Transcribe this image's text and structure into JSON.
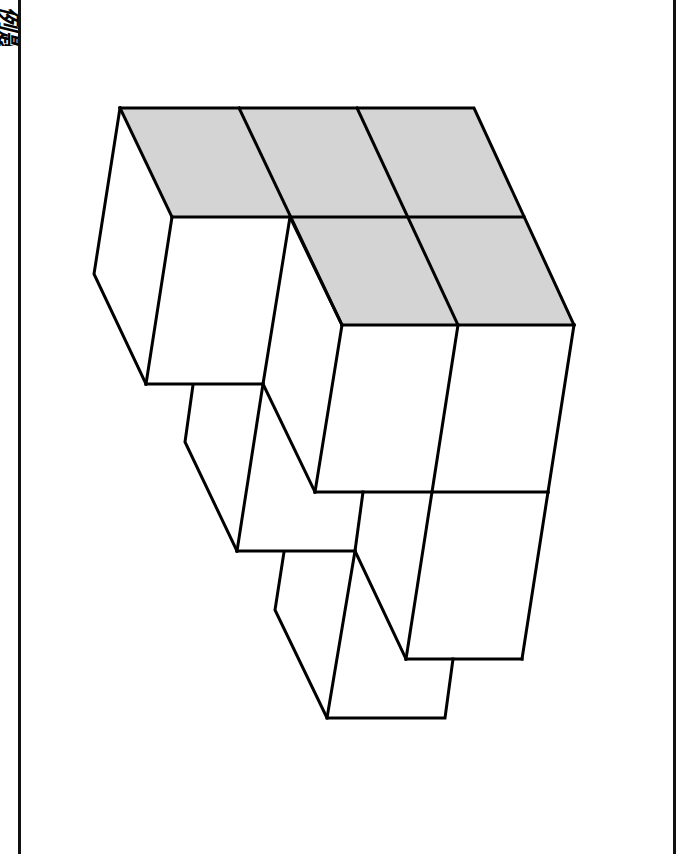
{
  "page": {
    "corner_label": "例题",
    "background": "#ffffff",
    "border_color": "#111111"
  },
  "figure": {
    "shade_color": "#d4d4d4",
    "line_color": "#000000",
    "top_faces_shaded": 5,
    "visible_cube_layers": 3
  }
}
